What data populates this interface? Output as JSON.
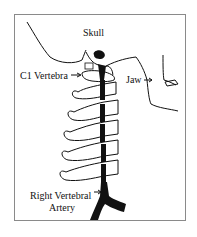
{
  "diagram": {
    "labels": {
      "skull": "Skull",
      "c1": "C1 Vertebra",
      "jaw": "Jaw",
      "artery_line1": "Right Vertebral",
      "artery_line2": "Artery"
    },
    "colors": {
      "ink": "#111111",
      "border": "#8a8a8a",
      "background": "#ffffff"
    }
  }
}
